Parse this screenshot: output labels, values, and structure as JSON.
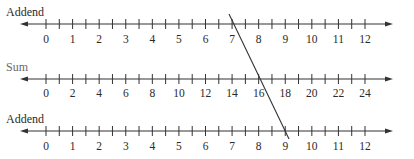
{
  "diagram": {
    "type": "addition-nomogram",
    "axes": [
      {
        "id": "addend-top",
        "label": "Addend",
        "label_color": "#2a2a2a",
        "line_y": 24,
        "label_y": 6,
        "numbers_y": 33,
        "min": 0,
        "max": 12,
        "label_step": 1,
        "minor_per_major": 2,
        "tick_labels": [
          "0",
          "1",
          "2",
          "3",
          "4",
          "5",
          "6",
          "7",
          "8",
          "9",
          "10",
          "11",
          "12"
        ]
      },
      {
        "id": "sum",
        "label": "Sum",
        "label_color": "#6a6a6a",
        "line_y": 79,
        "label_y": 61,
        "numbers_y": 87,
        "min": 0,
        "max": 24,
        "label_step": 2,
        "minor_per_major": 2,
        "tick_labels": [
          "0",
          "2",
          "4",
          "6",
          "8",
          "10",
          "12",
          "14",
          "16",
          "18",
          "20",
          "22",
          "24"
        ]
      },
      {
        "id": "addend-bottom",
        "label": "Addend",
        "label_color": "#2a2a2a",
        "line_y": 131,
        "label_y": 113,
        "numbers_y": 140,
        "min": 0,
        "max": 12,
        "label_step": 1,
        "minor_per_major": 2,
        "tick_labels": [
          "0",
          "1",
          "2",
          "3",
          "4",
          "5",
          "6",
          "7",
          "8",
          "9",
          "10",
          "11",
          "12"
        ]
      }
    ],
    "geometry": {
      "arrow_left_x": 20,
      "arrow_right_x": 393,
      "zero_x": 46,
      "last_major_x": 365,
      "major_count": 12,
      "label_x": 6
    },
    "solution_line": {
      "description": "Straight line connecting 7 on top Addend scale, 16 on Sum scale, 9 on bottom Addend scale",
      "top_addend": 7,
      "sum": 16,
      "bottom_addend": 9,
      "x1": 229,
      "y1": 14,
      "x2": 289,
      "y2": 139
    },
    "colors": {
      "line": "#333333",
      "text": "#2a2a2a",
      "sum_label": "#6a6a6a"
    }
  }
}
